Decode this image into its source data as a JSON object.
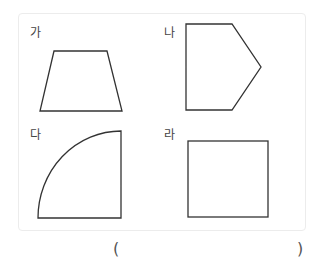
{
  "figure": {
    "labels": [
      "가",
      "나",
      "다",
      "라"
    ],
    "shapes": [
      {
        "label": "가",
        "type": "trapezoid"
      },
      {
        "label": "나",
        "type": "pentagon"
      },
      {
        "label": "다",
        "type": "quarter-circle"
      },
      {
        "label": "라",
        "type": "square"
      }
    ]
  },
  "answer": {
    "open_paren": "(",
    "close_paren": ")",
    "value": ""
  }
}
